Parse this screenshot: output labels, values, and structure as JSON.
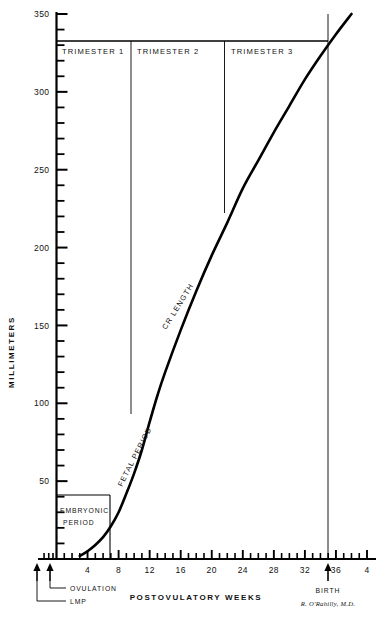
{
  "figure": {
    "title": "",
    "credit": "R. O'Rahilly, M.D."
  },
  "axes": {
    "y_title": "MILLIMETERS",
    "x_title": "POSTOVULATORY  WEEKS",
    "y_ticks": [
      "50",
      "100",
      "150",
      "200",
      "250",
      "300",
      "350"
    ],
    "x_ticks": [
      "4",
      "8",
      "12",
      "16",
      "20",
      "24",
      "28",
      "32",
      "36",
      "4"
    ]
  },
  "annotations": {
    "trimester_1": "TRIMESTER  1",
    "trimester_2": "TRIMESTER  2",
    "trimester_3": "TRIMESTER  3",
    "embryonic_1": "EMBRYONIC",
    "embryonic_2": "PERIOD",
    "fetal_period": "FETAL  PERIOD",
    "cr_length": "CR LENGTH",
    "ovulation": "OVULATION",
    "lmp": "LMP",
    "birth": "BIRTH"
  },
  "chart_data": {
    "type": "line",
    "title": "",
    "xlabel": "POSTOVULATORY  WEEKS",
    "ylabel": "MILLIMETERS",
    "xlim": [
      0,
      40
    ],
    "ylim": [
      0,
      350
    ],
    "grid": false,
    "legend": null,
    "y_major_step": 50,
    "y_minor_step": 10,
    "x_major_step": 4,
    "x_minor_step": 1,
    "series": [
      {
        "name": "CR LENGTH",
        "x": [
          3.0,
          4,
          5,
          6,
          7,
          8,
          9,
          10,
          11,
          12,
          13,
          14,
          16,
          18,
          20,
          22,
          24,
          26,
          28,
          30,
          32,
          34,
          36,
          38
        ],
        "values": [
          2,
          5,
          9,
          14,
          21,
          30,
          42,
          55,
          70,
          88,
          105,
          120,
          147,
          172,
          195,
          216,
          238,
          256,
          274,
          291,
          308,
          323,
          337,
          350
        ]
      }
    ],
    "markers": {
      "embryonic_period_end_week": 8,
      "embryonic_period_end_mm": 30,
      "trimester_1_end_week": 13,
      "trimester_2_end_week": 26,
      "trimester_2_end_mm": 240,
      "trimester_1_end_mm": 88,
      "birth_week": 38,
      "birth_mm": 340,
      "band_top_mm": 340,
      "ovulation_week": 0,
      "lmp_week": -1.5
    }
  }
}
